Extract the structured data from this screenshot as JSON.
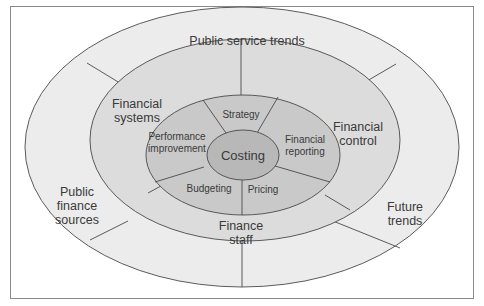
{
  "diagram": {
    "type": "concentric-ellipse",
    "colors": {
      "background": "#ffffff",
      "frame": "#8a8a8a",
      "outer_ring": "#ececec",
      "middle_ring": "#dcdcdc",
      "inner_ring": "#c9c9c9",
      "core": "#b8b8b8",
      "stroke": "#4a4a4a"
    },
    "outer_ring": {
      "segments": [
        {
          "label_lines": [
            "Public service trends"
          ]
        },
        {
          "label_lines": [
            "Future",
            "trends"
          ]
        },
        {
          "label_lines": [
            "Public",
            "finance",
            "sources"
          ]
        }
      ]
    },
    "middle_ring": {
      "segments": [
        {
          "label_lines": [
            "Financial",
            "systems"
          ]
        },
        {
          "label_lines": [
            "Financial",
            "control"
          ]
        },
        {
          "label_lines": [
            "Finance",
            "staff"
          ]
        }
      ]
    },
    "inner_ring": {
      "segments": [
        {
          "label_lines": [
            "Strategy"
          ]
        },
        {
          "label_lines": [
            "Financial",
            "reporting"
          ]
        },
        {
          "label_lines": [
            "Pricing"
          ]
        },
        {
          "label_lines": [
            "Budgeting"
          ]
        },
        {
          "label_lines": [
            "Performance",
            "improvement"
          ]
        }
      ]
    },
    "core": {
      "label": "Costing"
    }
  }
}
